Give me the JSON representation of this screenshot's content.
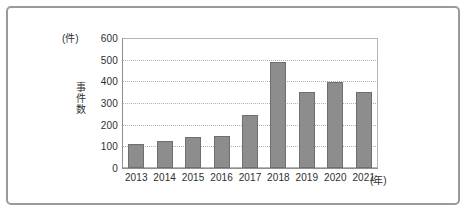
{
  "chart_data": {
    "type": "bar",
    "title": "",
    "xlabel": "(年)",
    "ylabel": "事件数",
    "unit_label": "(件)",
    "categories": [
      "2013",
      "2014",
      "2015",
      "2016",
      "2017",
      "2018",
      "2019",
      "2020",
      "2021"
    ],
    "values": [
      110,
      125,
      145,
      150,
      245,
      490,
      350,
      395,
      350
    ],
    "ylim": [
      0,
      600
    ],
    "ytick_labels": [
      "600",
      "500",
      "400",
      "300",
      "200",
      "100",
      "0"
    ],
    "ytick_values": [
      600,
      500,
      400,
      300,
      200,
      100,
      0
    ],
    "grid": "horizontal-dotted",
    "legend": "none",
    "bar_color": "#8d8d8d",
    "bar_border_color": "#6f6f6f",
    "gridline_color": "#b0b0b0",
    "axis_color": "#8f8f8f",
    "frame_color": "#9a9a9a",
    "background": "#ffffff"
  }
}
